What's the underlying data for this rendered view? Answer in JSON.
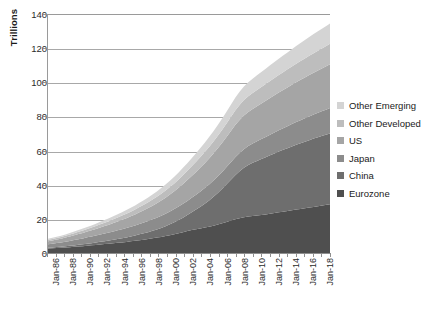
{
  "chart_data": {
    "type": "area",
    "stacked": true,
    "title": "",
    "xlabel": "",
    "ylabel": "Trillions",
    "ylim": [
      0,
      140
    ],
    "ytick_values": [
      0,
      20,
      40,
      60,
      80,
      100,
      120,
      140
    ],
    "ytick_labels": [
      "0",
      "20",
      "40",
      "60",
      "80",
      "100",
      "120",
      "140"
    ],
    "grid": "horizontal",
    "legend_position": "right",
    "x_tick_labels": [
      "Jan-86",
      "Jan-88",
      "Jan-90",
      "Jan-92",
      "Jan-94",
      "Jan-96",
      "Jan-98",
      "Jan-00",
      "Jan-02",
      "Jan-04",
      "Jan-06",
      "Jan-08",
      "Jan-10",
      "Jan-12",
      "Jan-14",
      "Jan-16",
      "Jan-18"
    ],
    "x_start_year": 1986,
    "x_end_year": 2019,
    "series": [
      {
        "name": "Eurozone",
        "color": "#4f4f4f",
        "values": [
          3.2,
          3.3,
          3.5,
          3.6,
          3.8,
          4.0,
          4.2,
          4.4,
          4.6,
          4.9,
          5.1,
          5.3,
          5.6,
          5.8,
          6.0,
          6.3,
          6.6,
          6.8,
          7.1,
          7.4,
          7.7,
          8.1,
          8.4,
          8.8,
          9.2,
          9.6,
          10.0,
          10.5,
          11.0,
          11.6,
          12.2,
          12.8,
          13.4,
          14.0,
          14.5,
          15.0,
          15.5,
          16.0,
          16.6,
          17.3,
          18.0,
          18.8,
          19.6,
          20.4,
          21.0,
          21.5,
          21.9,
          22.2,
          22.5,
          22.8,
          23.2,
          23.6,
          24.0,
          24.4,
          24.8,
          25.2,
          25.6,
          26.0,
          26.4,
          26.8,
          27.2,
          27.6,
          28.0,
          28.4,
          28.8,
          29.2
        ]
      },
      {
        "name": "China",
        "color": "#6e6e6e",
        "values": [
          0.5,
          0.55,
          0.6,
          0.65,
          0.7,
          0.78,
          0.85,
          0.95,
          1.05,
          1.15,
          1.25,
          1.4,
          1.55,
          1.7,
          1.85,
          2.0,
          2.2,
          2.4,
          2.6,
          2.85,
          3.1,
          3.4,
          3.7,
          4.0,
          4.4,
          4.8,
          5.3,
          5.8,
          6.4,
          7.0,
          7.7,
          8.5,
          9.4,
          10.4,
          11.5,
          12.7,
          14.0,
          15.4,
          16.9,
          18.5,
          20.2,
          22.0,
          23.9,
          25.8,
          27.5,
          29.0,
          30.2,
          31.2,
          32.0,
          32.8,
          33.5,
          34.2,
          34.9,
          35.6,
          36.2,
          36.8,
          37.4,
          38.0,
          38.5,
          39.0,
          39.5,
          40.0,
          40.4,
          40.8,
          41.2,
          41.6
        ]
      },
      {
        "name": "Japan",
        "color": "#8c8c8c",
        "values": [
          2.0,
          2.15,
          2.3,
          2.5,
          2.7,
          2.9,
          3.1,
          3.3,
          3.5,
          3.7,
          3.9,
          4.1,
          4.3,
          4.5,
          4.7,
          4.9,
          5.1,
          5.3,
          5.5,
          5.7,
          5.9,
          6.1,
          6.3,
          6.5,
          6.7,
          6.9,
          7.1,
          7.3,
          7.5,
          7.7,
          7.9,
          8.1,
          8.3,
          8.5,
          8.7,
          8.9,
          9.1,
          9.3,
          9.5,
          9.7,
          9.9,
          10.1,
          10.3,
          10.5,
          10.7,
          10.9,
          11.1,
          11.3,
          11.5,
          11.7,
          11.9,
          12.1,
          12.3,
          12.5,
          12.7,
          12.9,
          13.1,
          13.3,
          13.5,
          13.7,
          13.9,
          14.1,
          14.3,
          14.5,
          14.7,
          14.9
        ]
      },
      {
        "name": "US",
        "color": "#a5a5a5",
        "values": [
          1.8,
          1.95,
          2.1,
          2.25,
          2.4,
          2.6,
          2.8,
          3.0,
          3.2,
          3.4,
          3.6,
          3.85,
          4.1,
          4.35,
          4.6,
          4.9,
          5.2,
          5.5,
          5.8,
          6.1,
          6.45,
          6.8,
          7.2,
          7.6,
          8.0,
          8.4,
          8.9,
          9.4,
          9.9,
          10.4,
          11.0,
          11.6,
          12.2,
          12.8,
          13.4,
          14.0,
          14.6,
          15.2,
          15.8,
          16.4,
          17.0,
          17.6,
          18.2,
          18.8,
          19.3,
          19.7,
          20.0,
          20.3,
          20.6,
          20.9,
          21.2,
          21.5,
          21.8,
          22.1,
          22.4,
          22.7,
          23.0,
          23.3,
          23.6,
          23.9,
          24.2,
          24.5,
          24.8,
          25.1,
          25.4,
          25.7
        ]
      },
      {
        "name": "Other Developed",
        "color": "#bdbdbd",
        "values": [
          0.8,
          0.86,
          0.93,
          1.0,
          1.07,
          1.15,
          1.24,
          1.33,
          1.42,
          1.52,
          1.62,
          1.73,
          1.84,
          1.96,
          2.08,
          2.21,
          2.34,
          2.48,
          2.62,
          2.77,
          2.93,
          3.09,
          3.26,
          3.44,
          3.62,
          3.81,
          4.01,
          4.22,
          4.44,
          4.67,
          4.9,
          5.15,
          5.4,
          5.66,
          5.93,
          6.21,
          6.5,
          6.8,
          7.1,
          7.4,
          7.7,
          8.0,
          8.3,
          8.6,
          8.85,
          9.05,
          9.2,
          9.35,
          9.5,
          9.65,
          9.8,
          9.95,
          10.1,
          10.25,
          10.4,
          10.55,
          10.7,
          10.85,
          11.0,
          11.15,
          11.3,
          11.45,
          11.6,
          11.75,
          11.9,
          12.05
        ]
      },
      {
        "name": "Other Emerging",
        "color": "#d4d4d4",
        "values": [
          0.6,
          0.65,
          0.7,
          0.76,
          0.82,
          0.88,
          0.95,
          1.02,
          1.1,
          1.18,
          1.26,
          1.35,
          1.44,
          1.54,
          1.64,
          1.75,
          1.86,
          1.98,
          2.1,
          2.23,
          2.36,
          2.5,
          2.65,
          2.8,
          2.96,
          3.12,
          3.3,
          3.48,
          3.67,
          3.87,
          4.08,
          4.3,
          4.52,
          4.75,
          4.99,
          5.24,
          5.5,
          5.77,
          6.04,
          6.32,
          6.6,
          6.88,
          7.16,
          7.44,
          7.7,
          7.94,
          8.15,
          8.35,
          8.55,
          8.75,
          8.95,
          9.15,
          9.35,
          9.55,
          9.75,
          9.95,
          10.15,
          10.35,
          10.55,
          10.75,
          10.95,
          11.15,
          11.35,
          11.55,
          11.75,
          11.95
        ]
      }
    ]
  }
}
